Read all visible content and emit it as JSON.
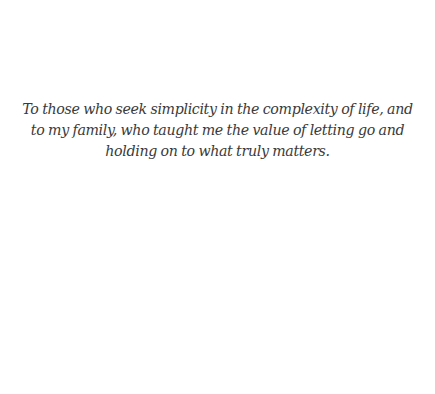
{
  "page": {
    "dedication": "To those who seek simplicity in the complexity of life, and to my family, who taught me the value of letting go and holding on to what truly matters."
  }
}
